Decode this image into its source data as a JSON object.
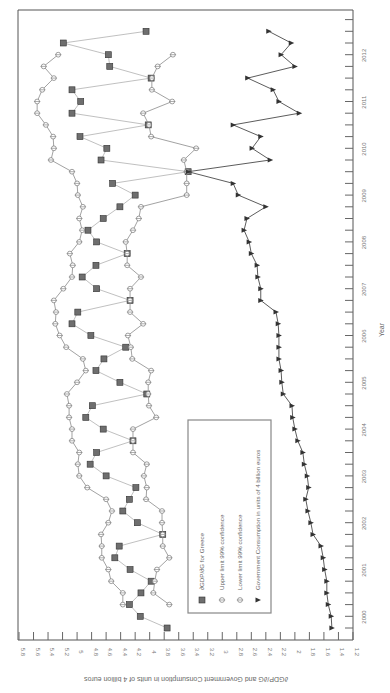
{
  "chart_data": {
    "type": "line",
    "orientation": "rotated-90-clockwise",
    "title": "",
    "xlabel": "Year",
    "ylabel": "∂GDP/∂G and Government Consumption in units of 4 billion euros",
    "ylim": [
      1.2,
      5.8
    ],
    "y_ticks": [
      "5.8",
      "5.6",
      "5.4",
      "5.2",
      "5",
      "4.8",
      "4.6",
      "4.4",
      "4.2",
      "4",
      "3.8",
      "3.6",
      "3.4",
      "3.2",
      "3",
      "2.8",
      "2.6",
      "2.4",
      "2.2",
      "2",
      "1.8",
      "1.6",
      "1.4",
      "1.2"
    ],
    "x_ticks": [
      "2000",
      "2001",
      "2002",
      "2003",
      "2004",
      "2005",
      "2006",
      "2007",
      "2008",
      "2009",
      "2010",
      "2011",
      "2012"
    ],
    "x_frequency": "quarterly",
    "x_start": "2000Q1",
    "legend_position": "inside, lower middle",
    "grid": false,
    "series": [
      {
        "name": "∂GDP/∂G for Greece",
        "marker": "square",
        "start_index": 0,
        "values": [
          3.76,
          4.13,
          4.28,
          4.12,
          3.98,
          4.27,
          4.48,
          4.42,
          3.82,
          4.17,
          4.37,
          4.28,
          4.19,
          4.6,
          4.82,
          4.73,
          4.23,
          4.64,
          4.88,
          4.79,
          4.04,
          4.41,
          4.74,
          4.63,
          4.33,
          4.81,
          5.07,
          4.99,
          4.27,
          4.73,
          4.93,
          4.74,
          4.31,
          4.73,
          4.85,
          4.64,
          4.41,
          4.2,
          4.51,
          3.47,
          4.67,
          4.59,
          4.96,
          4.02,
          5.07,
          4.95,
          5.07,
          3.98,
          4.55,
          4.57,
          5.19,
          4.05
        ]
      },
      {
        "name": "Upper limit 99% confidence",
        "marker": "circle-cross",
        "start_index": 2,
        "values": [
          4.37,
          4.37,
          4.53,
          4.57,
          4.66,
          4.66,
          4.67,
          4.57,
          4.52,
          4.6,
          4.86,
          4.97,
          4.99,
          4.97,
          5.07,
          5.07,
          5.11,
          5.11,
          5.14,
          5.0,
          4.88,
          4.92,
          5.15,
          5.24,
          5.3,
          5.29,
          5.32,
          5.19,
          5.07,
          5.06,
          5.1,
          4.97,
          4.93,
          4.97,
          4.92,
          4.99,
          5.0,
          5.07,
          5.36,
          5.32,
          5.33,
          5.43,
          5.55,
          5.55,
          5.48,
          5.32,
          5.46,
          5.26
        ]
      },
      {
        "name": "Lower limit 99% confidence",
        "marker": "circle-cross",
        "start_index": 2,
        "values": [
          3.73,
          3.95,
          3.93,
          3.9,
          3.73,
          3.82,
          3.82,
          3.83,
          3.83,
          4.05,
          4.04,
          4.08,
          4.04,
          4.23,
          4.23,
          4.23,
          3.91,
          4.01,
          4.02,
          4.02,
          3.98,
          4.24,
          4.26,
          4.3,
          4.09,
          4.27,
          4.27,
          4.27,
          4.12,
          4.31,
          4.31,
          4.33,
          4.23,
          4.15,
          4.12,
          3.49,
          3.49,
          3.49,
          3.53,
          3.36,
          3.98,
          4.01,
          4.09,
          3.69,
          3.97,
          3.97,
          3.89,
          3.68
        ]
      },
      {
        "name": "Government Consumption in units of 4 billion euros",
        "marker": "triangle",
        "start_index": 0,
        "values": [
          1.49,
          1.5,
          1.54,
          1.56,
          1.56,
          1.59,
          1.61,
          1.64,
          1.75,
          1.78,
          1.82,
          1.85,
          1.81,
          1.83,
          1.87,
          1.89,
          1.96,
          2.0,
          2.03,
          2.04,
          2.16,
          2.18,
          2.19,
          2.22,
          2.22,
          2.22,
          2.23,
          2.26,
          2.47,
          2.47,
          2.51,
          2.52,
          2.6,
          2.63,
          2.7,
          2.66,
          2.4,
          2.78,
          2.85,
          3.47,
          2.34,
          2.59,
          2.47,
          2.85,
          1.94,
          2.22,
          2.3,
          2.65,
          2.0,
          2.19,
          2.05,
          2.36
        ]
      }
    ]
  },
  "legend": {
    "items": [
      {
        "label": "∂GDP/∂G for Greece",
        "marker": "square"
      },
      {
        "label": "Upper limit 99% confidence",
        "marker": "circle-cross"
      },
      {
        "label": "Lower limit 99% confidence",
        "marker": "circle-cross"
      },
      {
        "label": "Government Consumption in units of 4 billion euros",
        "marker": "triangle"
      }
    ]
  },
  "colors": {
    "gdp_marker_fill": "#6e6e6e",
    "gdp_line": "#bbbbbb",
    "band_line": "#888888",
    "gov_line": "#555555",
    "axis": "#555555"
  }
}
